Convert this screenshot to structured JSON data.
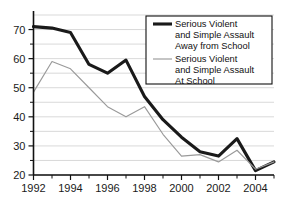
{
  "chart_data": {
    "type": "line",
    "title": "",
    "subtitle": "",
    "xlabel": "",
    "ylabel": "",
    "x": [
      1992,
      1993,
      1994,
      1995,
      1996,
      1997,
      1998,
      1999,
      2000,
      2001,
      2002,
      2003,
      2004,
      2005
    ],
    "xlim": [
      1992,
      2005
    ],
    "ylim": [
      20,
      75
    ],
    "xticks_major": [
      1992,
      1994,
      1996,
      1998,
      2000,
      2002,
      2004
    ],
    "xticks_minor": [
      1993,
      1995,
      1997,
      1999,
      2001,
      2003,
      2005
    ],
    "xtick_labels": [
      "1992",
      "1994",
      "1996",
      "1998",
      "2000",
      "2002",
      "2004"
    ],
    "yticks": [
      20,
      30,
      40,
      50,
      60,
      70
    ],
    "ytick_labels": [
      "20",
      "30",
      "40",
      "50",
      "60",
      "70"
    ],
    "gridlines_y": [
      20,
      25,
      30,
      35,
      40,
      45,
      50,
      55,
      60,
      65,
      70,
      75
    ],
    "grid": true,
    "grid_color": "#c8c8c8",
    "legend_position": "top-right",
    "series": [
      {
        "name": "Serious Violent and Simple Assault Away from School",
        "legend_lines": [
          "Serious Violent",
          "and Simple Assault",
          "Away from School"
        ],
        "color": "#1a1a1a",
        "width": 3.1,
        "values": [
          71,
          70.5,
          69,
          58,
          55,
          59.5,
          47,
          39,
          33,
          28,
          26.5,
          32.5,
          21.5,
          24.5
        ]
      },
      {
        "name": "Serious Violent and Simple Assault At School",
        "legend_lines": [
          "Serious Violent",
          "and Simple Assault",
          "At School"
        ],
        "color": "#9a9a9a",
        "width": 1.15,
        "values": [
          48.5,
          59,
          56.5,
          50,
          43.5,
          40,
          43.5,
          34,
          26.5,
          27,
          24.5,
          28.5,
          22,
          24.5
        ]
      }
    ]
  },
  "legend": {
    "entries": [
      {
        "line1": "Serious Violent",
        "line2": "and Simple Assault",
        "line3": "Away from School"
      },
      {
        "line1": "Serious Violent",
        "line2": "and Simple Assault",
        "line3": "At School"
      }
    ]
  },
  "axes": {
    "y_labels": [
      "70",
      "60",
      "50",
      "40",
      "30",
      "20"
    ],
    "x_labels": [
      "1992",
      "1994",
      "1996",
      "1998",
      "2000",
      "2002",
      "2004"
    ]
  }
}
